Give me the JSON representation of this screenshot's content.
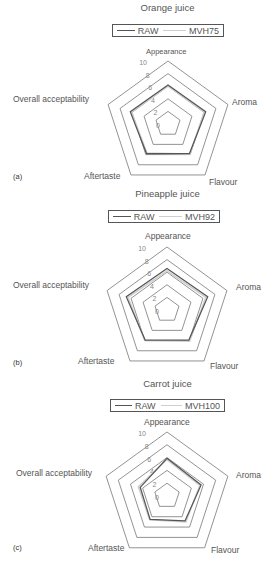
{
  "chart_data": [
    {
      "type": "radar",
      "panel_tag": "(a)",
      "title": "Orange juice",
      "axes": [
        "Appearance",
        "Aroma",
        "Flavour",
        "Aftertaste",
        "Overall acceptability"
      ],
      "rlim": [
        0,
        10
      ],
      "ticks": [
        "0",
        "2",
        "4",
        "6",
        "8",
        "10"
      ],
      "legend": [
        "RAW",
        "MVH75"
      ],
      "series": [
        {
          "name": "RAW",
          "color": "#555555",
          "values": [
            6.2,
            6.3,
            5.8,
            5.8,
            6.3
          ]
        },
        {
          "name": "MVH75",
          "color": "#cfcfcf",
          "values": [
            6.0,
            6.1,
            5.9,
            5.7,
            6.1
          ]
        }
      ]
    },
    {
      "type": "radar",
      "panel_tag": "(b)",
      "title": "Pineapple juice",
      "axes": [
        "Appearance",
        "Aroma",
        "Flavour",
        "Aftertaste",
        "Overall acceptability"
      ],
      "rlim": [
        0,
        10
      ],
      "ticks": [
        "0",
        "2",
        "4",
        "6",
        "8",
        "10"
      ],
      "legend": [
        "RAW",
        "MVH92"
      ],
      "series": [
        {
          "name": "RAW",
          "color": "#555555",
          "values": [
            6.6,
            6.8,
            5.9,
            5.9,
            6.8
          ]
        },
        {
          "name": "MVH92",
          "color": "#cfcfcf",
          "values": [
            6.2,
            6.5,
            6.1,
            6.0,
            6.5
          ]
        }
      ]
    },
    {
      "type": "radar",
      "panel_tag": "(c)",
      "title": "Carrot juice",
      "axes": [
        "Appearance",
        "Aroma",
        "Flavour",
        "Aftertaste",
        "Overall acceptability"
      ],
      "rlim": [
        0,
        10
      ],
      "ticks": [
        "0",
        "2",
        "4",
        "6",
        "8",
        "10"
      ],
      "legend": [
        "RAW",
        "MVH100"
      ],
      "series": [
        {
          "name": "RAW",
          "color": "#555555",
          "values": [
            5.9,
            5.6,
            4.8,
            4.5,
            4.4
          ]
        },
        {
          "name": "MVH100",
          "color": "#cfcfcf",
          "values": [
            5.7,
            5.4,
            5.0,
            4.6,
            4.7
          ]
        }
      ]
    }
  ],
  "panels": [
    {
      "tag": "(a)",
      "title": "Orange juice",
      "legend_raw": "RAW",
      "legend_mvh": "MVH75",
      "axis_appearance": "Appearance",
      "axis_aroma": "Aroma",
      "axis_flavour": "Flavour",
      "axis_aftertaste": "Aftertaste",
      "axis_overall": "Overall acceptability"
    },
    {
      "tag": "(b)",
      "title": "Pineapple juice",
      "legend_raw": "RAW",
      "legend_mvh": "MVH92",
      "axis_appearance": "Appearance",
      "axis_aroma": "Aroma",
      "axis_flavour": "Flavour",
      "axis_aftertaste": "Aftertaste",
      "axis_overall": "Overall acceptability"
    },
    {
      "tag": "(c)",
      "title": "Carrot juice",
      "legend_raw": "RAW",
      "legend_mvh": "MVH100",
      "axis_appearance": "Appearance",
      "axis_aroma": "Aroma",
      "axis_flavour": "Flavour",
      "axis_aftertaste": "Aftertaste",
      "axis_overall": "Overall acceptability"
    }
  ]
}
